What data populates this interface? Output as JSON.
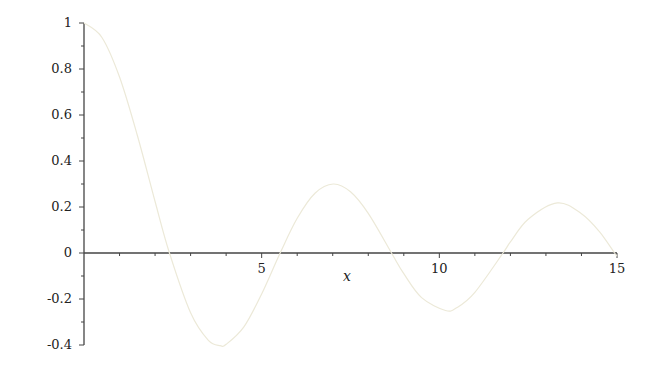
{
  "chart_data": {
    "type": "line",
    "title": "",
    "xlabel": "x",
    "ylabel": "",
    "xlim": [
      0,
      15
    ],
    "ylim": [
      -0.4,
      1
    ],
    "grid": false,
    "legend": null,
    "x_ticks": [
      {
        "value": 5,
        "label": "5"
      },
      {
        "value": 10,
        "label": "10"
      },
      {
        "value": 15,
        "label": "15"
      }
    ],
    "y_ticks": [
      {
        "value": 1,
        "label": "1"
      },
      {
        "value": 0.8,
        "label": "0.8"
      },
      {
        "value": 0.6,
        "label": "0.6"
      },
      {
        "value": 0.4,
        "label": "0.4"
      },
      {
        "value": 0.2,
        "label": "0.2"
      },
      {
        "value": 0,
        "label": "0"
      },
      {
        "value": -0.2,
        "label": "-0.2"
      },
      {
        "value": -0.4,
        "label": "-0.4"
      }
    ],
    "series": [
      {
        "name": "BesselJ(0, x)",
        "color": "#ece9d8",
        "x": [
          0,
          0.5,
          1,
          1.5,
          2,
          2.405,
          3,
          3.5,
          3.832,
          4,
          4.5,
          5,
          5.52,
          6,
          6.5,
          7.016,
          7.5,
          8,
          8.654,
          9,
          9.5,
          10.173,
          10.5,
          11,
          11.792,
          12,
          12.5,
          13.324,
          14,
          14.5,
          14.931,
          15
        ],
        "values": [
          1,
          0.938,
          0.765,
          0.512,
          0.224,
          0,
          -0.26,
          -0.38,
          -0.403,
          -0.397,
          -0.321,
          -0.178,
          0,
          0.151,
          0.26,
          0.3,
          0.266,
          0.172,
          0,
          -0.09,
          -0.194,
          -0.25,
          -0.237,
          -0.171,
          0,
          0.048,
          0.147,
          0.218,
          0.171,
          0.094,
          0,
          -0.014
        ]
      }
    ]
  },
  "axis_color": "#444444"
}
